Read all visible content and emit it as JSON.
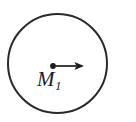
{
  "figure": {
    "background_color": "#ffffff",
    "stroke_color": "#2a2a2a",
    "width": 136,
    "height": 122
  },
  "circle": {
    "name": "boundary-circle",
    "center_x": 57.5,
    "center_y": 63.5,
    "radius": 49.5,
    "stroke_width": 2,
    "fill": "none",
    "stroke_color": "#2a2a2a"
  },
  "point_mass": {
    "name": "mass-point",
    "x": 53,
    "y": 66,
    "radius": 2.8,
    "color": "#1d1d1d"
  },
  "arrow": {
    "name": "velocity-arrow",
    "start_x": 53,
    "start_y": 66,
    "end_x": 84,
    "end_y": 66,
    "shaft_width": 1.6,
    "head_length": 10,
    "head_width": 8,
    "color": "#1d1d1d"
  },
  "label": {
    "name": "mass-label",
    "base": "M",
    "subscript": "1",
    "full_text": "M1",
    "color": "#1d1d1d"
  }
}
